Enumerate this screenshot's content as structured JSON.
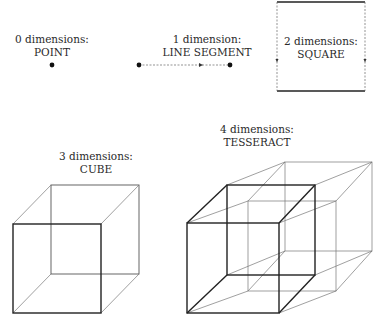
{
  "figure": {
    "panels": [
      {
        "id": "point",
        "title": "0 dimensions:",
        "name": "POINT"
      },
      {
        "id": "line",
        "title": "1 dimension:",
        "name": "LINE SEGMENT"
      },
      {
        "id": "square",
        "title": "2 dimensions:",
        "name": "SQUARE"
      },
      {
        "id": "cube",
        "title": "3 dimensions:",
        "name": "CUBE"
      },
      {
        "id": "tesseract",
        "title": "4 dimensions:",
        "name": "TESSERACT"
      }
    ]
  },
  "colors": {
    "background": "#ffffff",
    "stroke": "#222222",
    "text": "#2a2a2a"
  }
}
